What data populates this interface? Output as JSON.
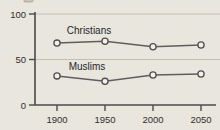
{
  "chart_data": {
    "type": "line",
    "title": "",
    "subtitle": "",
    "xlabel": "",
    "ylabel": "",
    "x": [
      1900,
      1950,
      2000,
      2050
    ],
    "xtick_labels": [
      "1900",
      "1950",
      "2000",
      "2050"
    ],
    "ytick_labels": [
      "0",
      "50",
      "100"
    ],
    "yticks": [
      0,
      50,
      100
    ],
    "ylim": [
      0,
      100
    ],
    "xlim": [
      1875,
      2075
    ],
    "grid": true,
    "grid_axis": "y",
    "legend": "inline-labels",
    "legend_position": "above-series",
    "series": [
      {
        "name": "Christians",
        "label": "Christians",
        "values": [
          68,
          70,
          64,
          66
        ],
        "color": "#5e5e5c",
        "marker": "open-circle"
      },
      {
        "name": "Muslims",
        "label": "Muslims",
        "values": [
          32,
          26,
          33,
          34
        ],
        "color": "#5e5e5c",
        "marker": "open-circle"
      }
    ],
    "annotations": [
      {
        "text": "Christians",
        "x": 1940,
        "y": 82
      },
      {
        "text": "Muslims",
        "x": 1938,
        "y": 46
      }
    ]
  },
  "style": {
    "background": "#e9e6de",
    "axis_color": "#4a4a48",
    "grid_color": "#b9b4a8",
    "line_color": "#5e5e5c",
    "marker_fill": "#f2f0ea",
    "text_color": "#2e2e2c"
  }
}
